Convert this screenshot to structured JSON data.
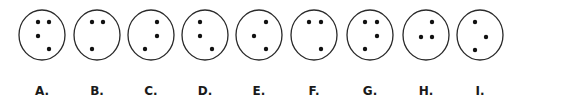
{
  "figure": {
    "stroke_color": "#2a2a2a",
    "dot_color": "#111111",
    "circle_radius": 23,
    "circle_cy": 35,
    "dot_radius": 2.2,
    "options": [
      {
        "label": "A.",
        "cx": 42,
        "dots": [
          [
            38,
            22
          ],
          [
            49,
            22
          ],
          [
            38,
            36
          ],
          [
            49,
            49
          ]
        ]
      },
      {
        "label": "B.",
        "cx": 97,
        "dots": [
          [
            92,
            22
          ],
          [
            103,
            22
          ],
          [
            92,
            49
          ]
        ]
      },
      {
        "label": "C.",
        "cx": 151,
        "dots": [
          [
            157,
            22
          ],
          [
            157,
            36
          ],
          [
            145,
            49
          ]
        ]
      },
      {
        "label": "D.",
        "cx": 205,
        "dots": [
          [
            200,
            22
          ],
          [
            200,
            36
          ],
          [
            212,
            49
          ]
        ]
      },
      {
        "label": "E.",
        "cx": 259,
        "dots": [
          [
            266,
            22
          ],
          [
            254,
            36
          ],
          [
            266,
            49
          ]
        ]
      },
      {
        "label": "F.",
        "cx": 314,
        "dots": [
          [
            309,
            22
          ],
          [
            321,
            22
          ],
          [
            321,
            49
          ]
        ]
      },
      {
        "label": "G.",
        "cx": 370,
        "dots": [
          [
            365,
            22
          ],
          [
            377,
            22
          ],
          [
            377,
            36
          ],
          [
            365,
            49
          ]
        ]
      },
      {
        "label": "H.",
        "cx": 426,
        "dots": [
          [
            432,
            22
          ],
          [
            421,
            37
          ],
          [
            432,
            37
          ]
        ]
      },
      {
        "label": "I.",
        "cx": 480,
        "dots": [
          [
            475,
            22
          ],
          [
            486,
            37
          ],
          [
            475,
            50
          ]
        ]
      }
    ]
  }
}
